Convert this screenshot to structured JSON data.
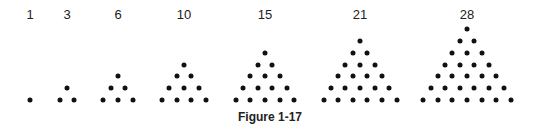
{
  "figure": {
    "caption": "Figure 1-17",
    "dot_color": "#111111",
    "triangles": [
      {
        "label": "1",
        "rows": 1,
        "center_x": 30
      },
      {
        "label": "3",
        "rows": 2,
        "center_x": 67
      },
      {
        "label": "6",
        "rows": 3,
        "center_x": 118
      },
      {
        "label": "10",
        "rows": 4,
        "center_x": 184
      },
      {
        "label": "15",
        "rows": 5,
        "center_x": 265
      },
      {
        "label": "21",
        "rows": 6,
        "center_x": 360
      },
      {
        "label": "28",
        "rows": 7,
        "center_x": 467
      }
    ]
  }
}
